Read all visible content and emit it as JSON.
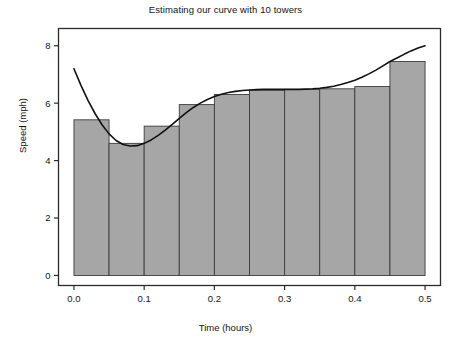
{
  "chart_data": {
    "type": "bar",
    "title": "Estimating our curve with 10 towers",
    "xlabel": "Time (hours)",
    "ylabel": "Speed (mph)",
    "xlim": [
      -0.022,
      0.522
    ],
    "ylim": [
      -0.35,
      8.6
    ],
    "xticks": [
      0.0,
      0.1,
      0.2,
      0.3,
      0.4,
      0.5
    ],
    "xticklabels": [
      "0.0",
      "0.1",
      "0.2",
      "0.3",
      "0.4",
      "0.5"
    ],
    "yticks": [
      0,
      2,
      4,
      6,
      8
    ],
    "yticklabels": [
      "0",
      "2",
      "4",
      "6",
      "8"
    ],
    "grid": false,
    "legend": null,
    "bar_width": 0.05,
    "bar_align": "left",
    "bar_facecolor": "#a6a6a6",
    "bar_edgecolor": "#3c3c3c",
    "categories": [
      0.0,
      0.05,
      0.1,
      0.15,
      0.2,
      0.25,
      0.3,
      0.35,
      0.4,
      0.45
    ],
    "values": [
      5.42,
      4.6,
      5.2,
      5.95,
      6.3,
      6.45,
      6.48,
      6.5,
      6.58,
      7.45
    ],
    "series": [
      {
        "name": "10 towers (left Riemann rectangles)",
        "type": "bar",
        "values": [
          5.42,
          4.6,
          5.2,
          5.95,
          6.3,
          6.45,
          6.48,
          6.5,
          6.58,
          7.45
        ]
      },
      {
        "name": "speed curve",
        "type": "line",
        "color": "#111111",
        "linewidth": 1.6,
        "x": [
          0.0,
          0.01,
          0.02,
          0.03,
          0.04,
          0.05,
          0.06,
          0.07,
          0.08,
          0.09,
          0.1,
          0.11,
          0.12,
          0.13,
          0.14,
          0.15,
          0.16,
          0.17,
          0.18,
          0.19,
          0.2,
          0.21,
          0.22,
          0.23,
          0.24,
          0.25,
          0.26,
          0.27,
          0.28,
          0.29,
          0.3,
          0.31,
          0.32,
          0.33,
          0.34,
          0.35,
          0.36,
          0.37,
          0.38,
          0.39,
          0.4,
          0.41,
          0.42,
          0.43,
          0.44,
          0.45,
          0.46,
          0.47,
          0.48,
          0.49,
          0.5
        ],
        "y": [
          7.2,
          6.62,
          6.1,
          5.64,
          5.25,
          4.93,
          4.7,
          4.56,
          4.51,
          4.52,
          4.6,
          4.72,
          4.88,
          5.06,
          5.26,
          5.47,
          5.67,
          5.85,
          6.0,
          6.13,
          6.23,
          6.31,
          6.37,
          6.41,
          6.44,
          6.46,
          6.47,
          6.48,
          6.48,
          6.48,
          6.48,
          6.48,
          6.48,
          6.49,
          6.5,
          6.52,
          6.55,
          6.59,
          6.65,
          6.72,
          6.8,
          6.9,
          7.02,
          7.15,
          7.3,
          7.45,
          7.57,
          7.7,
          7.82,
          7.92,
          8.0
        ]
      }
    ]
  },
  "figure": {
    "title": "Estimating our curve with 10 towers",
    "xlabel": "Time (hours)",
    "ylabel": "Speed (mph)",
    "background": "#ffffff",
    "frame_color": "#2b2b2b"
  }
}
